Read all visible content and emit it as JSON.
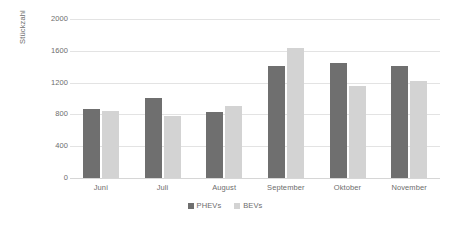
{
  "chart_data": {
    "type": "bar",
    "title": "",
    "subtitle": "",
    "xlabel": "",
    "ylabel": "Stückzahl",
    "categories": [
      "Juni",
      "Juli",
      "August",
      "September",
      "Oktober",
      "November"
    ],
    "series": [
      {
        "name": "PHEVs",
        "color": "#6f6f6f",
        "values": [
          870,
          1010,
          830,
          1410,
          1450,
          1410
        ]
      },
      {
        "name": "BEVs",
        "color": "#d3d3d3",
        "values": [
          840,
          780,
          900,
          1640,
          1160,
          1220
        ]
      }
    ],
    "ylim": [
      0,
      2000
    ],
    "yticks": [
      0,
      400,
      800,
      1200,
      1600,
      2000
    ],
    "ytick_labels": [
      "0",
      "400",
      "800",
      "1200",
      "1600",
      "2000"
    ],
    "grid": {
      "horizontal": true,
      "vertical": false,
      "color": "#e3e3e3"
    },
    "legend": {
      "position": "bottom",
      "entries": [
        "PHEVs",
        "BEVs"
      ]
    },
    "background": "#ffffff",
    "text_color": "#6d6d6d"
  }
}
